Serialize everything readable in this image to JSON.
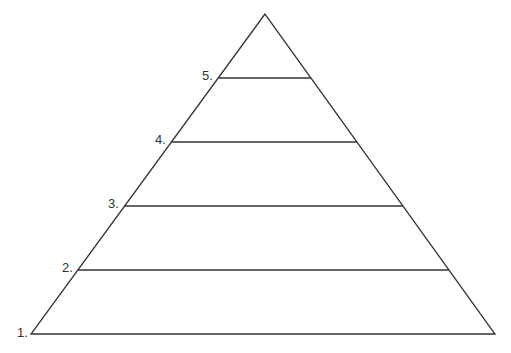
{
  "diagram": {
    "type": "pyramid",
    "levels": [
      {
        "label": "1.",
        "x": 17,
        "y": 326
      },
      {
        "label": "2.",
        "x": 61,
        "y": 261
      },
      {
        "label": "3.",
        "x": 108,
        "y": 197
      },
      {
        "label": "4.",
        "x": 155,
        "y": 133
      },
      {
        "label": "5.",
        "x": 202,
        "y": 69
      }
    ],
    "stroke_color": "#333333"
  }
}
